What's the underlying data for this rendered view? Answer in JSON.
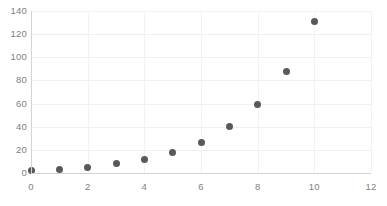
{
  "chart_data": {
    "type": "scatter",
    "title": "",
    "subtitle": "",
    "xlabel": "",
    "ylabel": "",
    "x": [
      0,
      1,
      2,
      3,
      4,
      5,
      6,
      7,
      8,
      9,
      10
    ],
    "values": [
      2,
      3,
      5,
      8,
      12,
      18,
      26,
      40,
      59,
      88,
      131
    ],
    "series": [
      {
        "name": "",
        "x": [
          0,
          1,
          2,
          3,
          4,
          5,
          6,
          7,
          8,
          9,
          10
        ],
        "values": [
          2,
          3,
          5,
          8,
          12,
          18,
          26,
          40,
          59,
          88,
          131
        ]
      }
    ],
    "xlim": [
      0,
      12
    ],
    "ylim": [
      0,
      140
    ],
    "xticks": [
      0,
      2,
      4,
      6,
      8,
      10,
      12
    ],
    "yticks": [
      0,
      20,
      40,
      60,
      80,
      100,
      120,
      140
    ],
    "xtick_labels": [
      "0",
      "2",
      "4",
      "6",
      "8",
      "10",
      "12"
    ],
    "ytick_labels": [
      "0",
      "20",
      "40",
      "60",
      "80",
      "100",
      "120",
      "140"
    ],
    "grid": "horizontal-and-vertical",
    "legend": "none",
    "marker": "circle",
    "marker_color": "#595959",
    "gridline_color": "#f0f0f0",
    "axis_color": "#d3d3d3",
    "tick_label_color": "#808080",
    "background_color": "#ffffff",
    "annotations": []
  }
}
